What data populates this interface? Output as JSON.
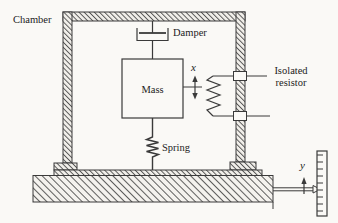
{
  "figure": {
    "type": "mechanical-diagram",
    "colors": {
      "paper": "#faf9f6",
      "ink": "#3a3a3a"
    },
    "labels": {
      "chamber": "Chamber",
      "damper": "Damper",
      "mass": "Mass",
      "spring": "Spring",
      "isolated_resistor_line1": "Isolated",
      "isolated_resistor_line2": "resistor",
      "x_displacement": "x",
      "y_displacement": "y"
    }
  }
}
